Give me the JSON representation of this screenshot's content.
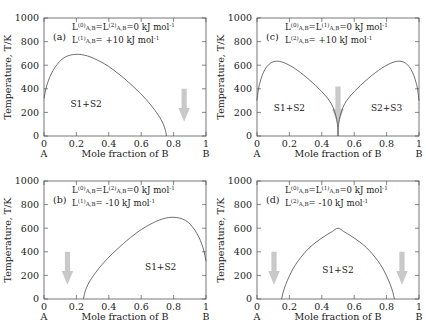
{
  "figure": {
    "axis": {
      "ylabel": "Temperature, T/K",
      "xlabel": "Mole fraction of B",
      "yticks": [
        "0",
        "200",
        "400",
        "600",
        "800",
        "1000"
      ],
      "xticks": [
        "0",
        "0.2",
        "0.4",
        "0.6",
        "0.8",
        "1"
      ],
      "ylim": [
        0,
        1000
      ],
      "xlim": [
        0,
        1
      ],
      "left_end_label": "A",
      "right_end_label": "B",
      "grid": false
    },
    "arrow_color": "#c9c9c9",
    "curve_color": "#4a4a4a"
  },
  "chart_data": [
    {
      "type": "line",
      "panel": "a",
      "tag": "(a)",
      "title": "",
      "xlabel": "Mole fraction of B",
      "ylabel": "Temperature, T/K",
      "xlim": [
        0,
        1
      ],
      "ylim": [
        0,
        1000
      ],
      "equations": [
        {
          "parts": [
            {
              "t": "L",
              "k": "base"
            },
            {
              "t": "(0)",
              "k": "sup"
            },
            {
              "t": "A,B",
              "k": "sub"
            },
            {
              "t": "=",
              "k": "base"
            },
            {
              "t": "L",
              "k": "base"
            },
            {
              "t": "(2)",
              "k": "sup"
            },
            {
              "t": "A,B",
              "k": "sub"
            },
            {
              "t": "=0 kJ mol",
              "k": "base"
            },
            {
              "t": "-1",
              "k": "sup"
            }
          ]
        },
        {
          "parts": [
            {
              "t": "L",
              "k": "base"
            },
            {
              "t": "(1)",
              "k": "sup"
            },
            {
              "t": "A,B",
              "k": "sub"
            },
            {
              "t": "= +10 kJ mol",
              "k": "base"
            },
            {
              "t": "-1",
              "k": "sup"
            }
          ]
        }
      ],
      "regions": [
        {
          "label": "S1+S2",
          "x": 0.26,
          "y": 250
        }
      ],
      "arrows": [
        {
          "x": 0.865,
          "y_top": 400,
          "y_bottom": 120
        }
      ],
      "series": [
        {
          "name": "miscibility-gap",
          "points": [
            [
              0.0,
              320
            ],
            [
              0.01,
              390
            ],
            [
              0.02,
              440
            ],
            [
              0.035,
              497
            ],
            [
              0.055,
              553
            ],
            [
              0.08,
              605
            ],
            [
              0.11,
              650
            ],
            [
              0.145,
              678
            ],
            [
              0.18,
              690
            ],
            [
              0.215,
              692
            ],
            [
              0.25,
              685
            ],
            [
              0.29,
              668
            ],
            [
              0.33,
              643
            ],
            [
              0.375,
              610
            ],
            [
              0.42,
              569
            ],
            [
              0.465,
              522
            ],
            [
              0.51,
              470
            ],
            [
              0.55,
              420
            ],
            [
              0.59,
              368
            ],
            [
              0.63,
              310
            ],
            [
              0.665,
              253
            ],
            [
              0.695,
              198
            ],
            [
              0.72,
              145
            ],
            [
              0.738,
              95
            ],
            [
              0.75,
              45
            ],
            [
              0.756,
              0
            ]
          ]
        }
      ]
    },
    {
      "type": "line",
      "panel": "c",
      "tag": "(c)",
      "title": "",
      "xlabel": "Mole fraction of B",
      "ylabel": "Temperature, T/K",
      "xlim": [
        0,
        1
      ],
      "ylim": [
        0,
        1000
      ],
      "equations": [
        {
          "parts": [
            {
              "t": "L",
              "k": "base"
            },
            {
              "t": "(0)",
              "k": "sup"
            },
            {
              "t": "A,B",
              "k": "sub"
            },
            {
              "t": "=",
              "k": "base"
            },
            {
              "t": "L",
              "k": "base"
            },
            {
              "t": "(1)",
              "k": "sup"
            },
            {
              "t": "A,B",
              "k": "sub"
            },
            {
              "t": "=0 kJ mol",
              "k": "base"
            },
            {
              "t": "-1",
              "k": "sup"
            }
          ]
        },
        {
          "parts": [
            {
              "t": "L",
              "k": "base"
            },
            {
              "t": "(2)",
              "k": "sup"
            },
            {
              "t": "A,B",
              "k": "sub"
            },
            {
              "t": "= +10 kJ mol",
              "k": "base"
            },
            {
              "t": "-1",
              "k": "sup"
            }
          ]
        }
      ],
      "regions": [
        {
          "label": "S1+S2",
          "x": 0.2,
          "y": 215
        },
        {
          "label": "S2+S3",
          "x": 0.8,
          "y": 215
        }
      ],
      "arrows": [
        {
          "x": 0.5,
          "y_top": 420,
          "y_bottom": 90
        }
      ],
      "series": [
        {
          "name": "left-dome",
          "points": [
            [
              0.0,
              300
            ],
            [
              0.008,
              390
            ],
            [
              0.018,
              452
            ],
            [
              0.032,
              513
            ],
            [
              0.05,
              566
            ],
            [
              0.072,
              605
            ],
            [
              0.098,
              628
            ],
            [
              0.125,
              634
            ],
            [
              0.152,
              628
            ],
            [
              0.182,
              612
            ],
            [
              0.215,
              588
            ],
            [
              0.25,
              556
            ],
            [
              0.288,
              517
            ],
            [
              0.325,
              474
            ],
            [
              0.362,
              428
            ],
            [
              0.398,
              379
            ],
            [
              0.43,
              330
            ],
            [
              0.458,
              275
            ],
            [
              0.478,
              210
            ],
            [
              0.492,
              140
            ],
            [
              0.499,
              60
            ],
            [
              0.5,
              0
            ]
          ]
        },
        {
          "name": "right-dome",
          "points": [
            [
              0.5,
              0
            ],
            [
              0.501,
              60
            ],
            [
              0.508,
              140
            ],
            [
              0.522,
              210
            ],
            [
              0.542,
              275
            ],
            [
              0.57,
              330
            ],
            [
              0.602,
              379
            ],
            [
              0.638,
              428
            ],
            [
              0.675,
              474
            ],
            [
              0.712,
              517
            ],
            [
              0.75,
              556
            ],
            [
              0.785,
              588
            ],
            [
              0.818,
              612
            ],
            [
              0.848,
              628
            ],
            [
              0.875,
              634
            ],
            [
              0.902,
              628
            ],
            [
              0.928,
              605
            ],
            [
              0.95,
              566
            ],
            [
              0.968,
              513
            ],
            [
              0.982,
              452
            ],
            [
              0.992,
              390
            ],
            [
              1.0,
              300
            ]
          ]
        }
      ]
    },
    {
      "type": "line",
      "panel": "b",
      "tag": "(b)",
      "title": "",
      "xlabel": "Mole fraction of B",
      "ylabel": "Temperature, T/K",
      "xlim": [
        0,
        1
      ],
      "ylim": [
        0,
        1000
      ],
      "equations": [
        {
          "parts": [
            {
              "t": "L",
              "k": "base"
            },
            {
              "t": "(0)",
              "k": "sup"
            },
            {
              "t": "A,B",
              "k": "sub"
            },
            {
              "t": "=",
              "k": "base"
            },
            {
              "t": "L",
              "k": "base"
            },
            {
              "t": "(2)",
              "k": "sup"
            },
            {
              "t": "A,B",
              "k": "sub"
            },
            {
              "t": "=0 kJ mol",
              "k": "base"
            },
            {
              "t": "-1",
              "k": "sup"
            }
          ]
        },
        {
          "parts": [
            {
              "t": "L",
              "k": "base"
            },
            {
              "t": "(1)",
              "k": "sup"
            },
            {
              "t": "A,B",
              "k": "sub"
            },
            {
              "t": "= -10 kJ mol",
              "k": "base"
            },
            {
              "t": "-1",
              "k": "sup"
            }
          ]
        }
      ],
      "regions": [
        {
          "label": "S1+S2",
          "x": 0.72,
          "y": 250
        }
      ],
      "arrows": [
        {
          "x": 0.145,
          "y_top": 400,
          "y_bottom": 120
        }
      ],
      "series": [
        {
          "name": "miscibility-gap",
          "points": [
            [
              0.244,
              0
            ],
            [
              0.25,
              45
            ],
            [
              0.262,
              95
            ],
            [
              0.28,
              145
            ],
            [
              0.305,
              198
            ],
            [
              0.335,
              253
            ],
            [
              0.37,
              310
            ],
            [
              0.41,
              368
            ],
            [
              0.45,
              420
            ],
            [
              0.49,
              470
            ],
            [
              0.535,
              522
            ],
            [
              0.58,
              569
            ],
            [
              0.625,
              610
            ],
            [
              0.67,
              643
            ],
            [
              0.71,
              668
            ],
            [
              0.75,
              685
            ],
            [
              0.785,
              692
            ],
            [
              0.82,
              690
            ],
            [
              0.855,
              678
            ],
            [
              0.89,
              650
            ],
            [
              0.92,
              605
            ],
            [
              0.945,
              553
            ],
            [
              0.965,
              497
            ],
            [
              0.98,
              440
            ],
            [
              0.99,
              390
            ],
            [
              1.0,
              320
            ]
          ]
        }
      ]
    },
    {
      "type": "line",
      "panel": "d",
      "tag": "(d)",
      "title": "",
      "xlabel": "Mole fraction of B",
      "ylabel": "Temperature, T/K",
      "xlim": [
        0,
        1
      ],
      "ylim": [
        0,
        1000
      ],
      "equations": [
        {
          "parts": [
            {
              "t": "L",
              "k": "base"
            },
            {
              "t": "(0)",
              "k": "sup"
            },
            {
              "t": "A,B",
              "k": "sub"
            },
            {
              "t": "=",
              "k": "base"
            },
            {
              "t": "L",
              "k": "base"
            },
            {
              "t": "(1)",
              "k": "sup"
            },
            {
              "t": "A,B",
              "k": "sub"
            },
            {
              "t": "=0 kJ mol",
              "k": "base"
            },
            {
              "t": "-1",
              "k": "sup"
            }
          ]
        },
        {
          "parts": [
            {
              "t": "L",
              "k": "base"
            },
            {
              "t": "(2)",
              "k": "sup"
            },
            {
              "t": "A,B",
              "k": "sub"
            },
            {
              "t": "= -10 kJ mol",
              "k": "base"
            },
            {
              "t": "-1",
              "k": "sup"
            }
          ]
        }
      ],
      "regions": [
        {
          "label": "S1+S2",
          "x": 0.5,
          "y": 220
        }
      ],
      "arrows": [
        {
          "x": 0.105,
          "y_top": 400,
          "y_bottom": 120
        },
        {
          "x": 0.895,
          "y_top": 400,
          "y_bottom": 120
        }
      ],
      "series": [
        {
          "name": "miscibility-gap",
          "points": [
            [
              0.152,
              0
            ],
            [
              0.162,
              60
            ],
            [
              0.178,
              125
            ],
            [
              0.2,
              195
            ],
            [
              0.225,
              262
            ],
            [
              0.255,
              325
            ],
            [
              0.288,
              382
            ],
            [
              0.322,
              432
            ],
            [
              0.358,
              475
            ],
            [
              0.395,
              512
            ],
            [
              0.432,
              545
            ],
            [
              0.465,
              572
            ],
            [
              0.5,
              600
            ],
            [
              0.535,
              572
            ],
            [
              0.568,
              545
            ],
            [
              0.605,
              512
            ],
            [
              0.642,
              475
            ],
            [
              0.678,
              432
            ],
            [
              0.712,
              382
            ],
            [
              0.745,
              325
            ],
            [
              0.775,
              262
            ],
            [
              0.8,
              195
            ],
            [
              0.822,
              125
            ],
            [
              0.838,
              60
            ],
            [
              0.848,
              0
            ]
          ]
        }
      ]
    }
  ]
}
